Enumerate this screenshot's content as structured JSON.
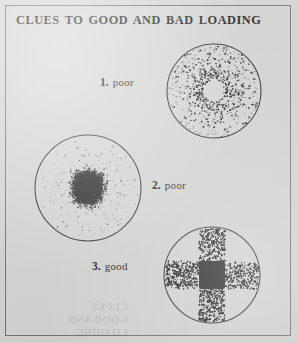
{
  "figure": {
    "title": "CLUES TO GOOD AND BAD LOADING",
    "background_color": "#d3d3d2",
    "ink_color": "#1a1a1a",
    "frame_color": "#6f6f6e",
    "width": 298,
    "height": 343
  },
  "panels": [
    {
      "id": "panel-1",
      "number": "1.",
      "verdict": "poor",
      "caption": "1. poor",
      "pattern": "ring-with-hollow-center",
      "description": "Dense annular ring of stipple dots with an empty white center hole and sparse scattered dots toward the rim",
      "center_x": 214,
      "center_y": 91,
      "radius": 47
    },
    {
      "id": "panel-2",
      "number": "2.",
      "verdict": "poor",
      "caption": "2. poor",
      "pattern": "central-dense-blob",
      "description": "Dense gaussian cluster of stipple dots concentrated in the middle, fading toward the rim",
      "center_x": 90,
      "center_y": 187,
      "radius": 53
    },
    {
      "id": "panel-3",
      "number": "3.",
      "verdict": "good",
      "caption": "3. good",
      "pattern": "cross-bands-with-solid-core",
      "description": "Horizontal and vertical stippled bands forming a cross, with a solid dark square at the center",
      "center_x": 212,
      "center_y": 275,
      "radius": 48
    }
  ],
  "captions": {
    "one": {
      "num": "1.",
      "word": "poor"
    },
    "two": {
      "num": "2.",
      "word": "poor"
    },
    "three": {
      "num": "3.",
      "word": "good"
    }
  },
  "ghost_text": {
    "line1": "CLUES",
    "line2": "GOOD AND",
    "line3": "LOADING"
  }
}
